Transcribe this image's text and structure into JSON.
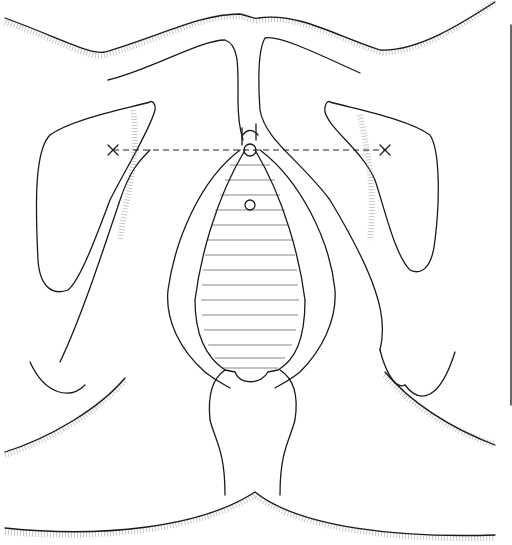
{
  "figure": {
    "type": "anatomical line illustration",
    "style": "black ink line drawing with stippled shading",
    "colors": {
      "line": "#1a1a1a",
      "background": "#ffffff",
      "stipple": "#9a9a9a"
    },
    "markers": [
      {
        "name": "left-x-mark",
        "symbol": "×"
      },
      {
        "name": "right-x-mark",
        "symbol": "×"
      }
    ],
    "reference_line": "horizontal dashed line between the two × marks",
    "scale_bar": "vertical line at right edge"
  }
}
